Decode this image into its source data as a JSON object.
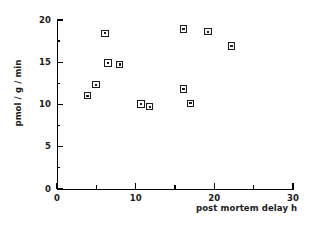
{
  "chart_data": {
    "type": "scatter",
    "title": "",
    "subtitle": "",
    "xlabel": "post mortem delay h",
    "ylabel": "pmol / g / min",
    "xlim": [
      0,
      30
    ],
    "ylim": [
      0,
      20
    ],
    "grid": false,
    "legend": null,
    "x_major_ticks": [
      0,
      10,
      20,
      30
    ],
    "x_minor_ticks": [
      5,
      15,
      25
    ],
    "y_major_ticks": [
      0,
      5,
      10,
      15,
      20
    ],
    "y_minor_ticks": [
      2.5,
      7.5,
      12.5,
      17.5
    ],
    "x_tick_labels": [
      "0",
      "10",
      "20",
      "30"
    ],
    "y_tick_labels": [
      "0",
      "5",
      "10",
      "15",
      "20"
    ],
    "marker_style": "open-square-with-center-dot",
    "marker_color": "#1c1c1c",
    "points": [
      {
        "x": 3.9,
        "y": 11.0
      },
      {
        "x": 5.0,
        "y": 12.3
      },
      {
        "x": 6.1,
        "y": 18.4
      },
      {
        "x": 6.5,
        "y": 14.9
      },
      {
        "x": 8.0,
        "y": 14.7
      },
      {
        "x": 10.7,
        "y": 10.0
      },
      {
        "x": 11.8,
        "y": 9.7
      },
      {
        "x": 16.1,
        "y": 18.9
      },
      {
        "x": 16.1,
        "y": 11.8
      },
      {
        "x": 17.0,
        "y": 10.1
      },
      {
        "x": 19.2,
        "y": 18.6
      },
      {
        "x": 22.2,
        "y": 16.9
      }
    ]
  },
  "axes": {
    "x_title": "post mortem delay h",
    "y_title": "pmol / g / min"
  }
}
